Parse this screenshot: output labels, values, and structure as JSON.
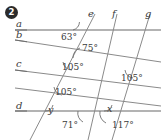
{
  "problem": {
    "number": "2"
  },
  "figure": {
    "type": "geometry-diagram",
    "line_color": "#8a8a8a",
    "rule_color": "#9a9a9a",
    "text_color": "#3a3a3a",
    "line_labels": [
      {
        "name": "line-label-a",
        "text": "a",
        "x": 16,
        "y": 19
      },
      {
        "name": "line-label-b",
        "text": "b",
        "x": 16,
        "y": 30
      },
      {
        "name": "line-label-c",
        "text": "c",
        "x": 16,
        "y": 59
      },
      {
        "name": "line-label-d",
        "text": "d",
        "x": 16,
        "y": 101
      },
      {
        "name": "line-label-e",
        "text": "e",
        "x": 88,
        "y": 9
      },
      {
        "name": "line-label-f",
        "text": "f",
        "x": 112,
        "y": 9
      },
      {
        "name": "line-label-g",
        "text": "g",
        "x": 145,
        "y": 9
      }
    ],
    "angle_labels": [
      {
        "name": "angle-63",
        "text": "63°",
        "x": 61,
        "y": 33
      },
      {
        "name": "angle-75",
        "text": "75°",
        "x": 82,
        "y": 44
      },
      {
        "name": "angle-105-upper-left",
        "text": "105°",
        "x": 62,
        "y": 63
      },
      {
        "name": "angle-105-right",
        "text": "105°",
        "x": 121,
        "y": 74
      },
      {
        "name": "angle-105-lower-left",
        "text": "105°",
        "x": 55,
        "y": 88
      },
      {
        "name": "angle-71",
        "text": "71°",
        "x": 62,
        "y": 121
      },
      {
        "name": "angle-117",
        "text": "117°",
        "x": 112,
        "y": 121
      }
    ],
    "variable_labels": [
      {
        "name": "angle-variable-y",
        "text": "y",
        "x": 48,
        "y": 105
      },
      {
        "name": "angle-variable-x",
        "text": "x",
        "x": 107,
        "y": 104
      }
    ]
  }
}
